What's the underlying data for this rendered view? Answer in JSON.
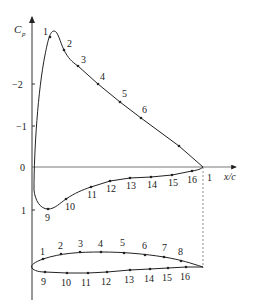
{
  "diagram": {
    "y_axis_label": "C",
    "y_axis_label_sub": "p",
    "x_axis_label": "x/c",
    "y_ticks": [
      {
        "label": "−2",
        "y": 84
      },
      {
        "label": "−1",
        "y": 126
      },
      {
        "label": "0",
        "y": 167
      },
      {
        "label": "1",
        "y": 210
      }
    ],
    "te_label": "1",
    "upper_points": [
      {
        "label": "1",
        "x": 50,
        "y": 37,
        "lx": 43,
        "ly": 35
      },
      {
        "label": "2",
        "x": 64,
        "y": 50,
        "lx": 67,
        "ly": 47
      },
      {
        "label": "3",
        "x": 78,
        "y": 66,
        "lx": 81,
        "ly": 63
      },
      {
        "label": "4",
        "x": 98,
        "y": 84,
        "lx": 100,
        "ly": 80
      },
      {
        "label": "5",
        "x": 120,
        "y": 102,
        "lx": 122,
        "ly": 97
      },
      {
        "label": "6",
        "x": 141,
        "y": 118,
        "lx": 142,
        "ly": 113
      },
      {
        "label": "7",
        "x": 179,
        "y": 146,
        "lx": 0,
        "ly": 0
      }
    ],
    "lower_points": [
      {
        "label": "9",
        "x": 48,
        "y": 209,
        "lx": 45,
        "ly": 221
      },
      {
        "label": "10",
        "x": 66,
        "y": 199,
        "lx": 65,
        "ly": 210
      },
      {
        "label": "11",
        "x": 91,
        "y": 187,
        "lx": 87,
        "ly": 198
      },
      {
        "label": "12",
        "x": 110,
        "y": 181,
        "lx": 106,
        "ly": 192
      },
      {
        "label": "13",
        "x": 130,
        "y": 178,
        "lx": 126,
        "ly": 189
      },
      {
        "label": "14",
        "x": 151,
        "y": 177,
        "lx": 147,
        "ly": 188
      },
      {
        "label": "15",
        "x": 172,
        "y": 175,
        "lx": 168,
        "ly": 186
      },
      {
        "label": "16",
        "x": 192,
        "y": 171,
        "lx": 187,
        "ly": 183
      }
    ],
    "airfoil_upper_points": [
      {
        "label": "1",
        "x": 43,
        "y": 259,
        "lx": 40,
        "ly": 255
      },
      {
        "label": "2",
        "x": 61,
        "y": 254,
        "lx": 58,
        "ly": 249
      },
      {
        "label": "3",
        "x": 80,
        "y": 252,
        "lx": 78,
        "ly": 247
      },
      {
        "label": "4",
        "x": 101,
        "y": 252,
        "lx": 98,
        "ly": 247
      },
      {
        "label": "5",
        "x": 124,
        "y": 253,
        "lx": 120,
        "ly": 246
      },
      {
        "label": "6",
        "x": 145,
        "y": 255,
        "lx": 142,
        "ly": 249
      },
      {
        "label": "7",
        "x": 164,
        "y": 257,
        "lx": 162,
        "ly": 251
      },
      {
        "label": "8",
        "x": 181,
        "y": 261,
        "lx": 178,
        "ly": 255
      }
    ],
    "airfoil_lower_points": [
      {
        "label": "9",
        "x": 45,
        "y": 272,
        "lx": 41,
        "ly": 285
      },
      {
        "label": "10",
        "x": 67,
        "y": 273,
        "lx": 61,
        "ly": 286
      },
      {
        "label": "11",
        "x": 88,
        "y": 273,
        "lx": 81,
        "ly": 286
      },
      {
        "label": "12",
        "x": 107,
        "y": 272,
        "lx": 101,
        "ly": 285
      },
      {
        "label": "13",
        "x": 130,
        "y": 270,
        "lx": 124,
        "ly": 283
      },
      {
        "label": "14",
        "x": 150,
        "y": 269,
        "lx": 144,
        "ly": 282
      },
      {
        "label": "15",
        "x": 168,
        "y": 268,
        "lx": 162,
        "ly": 281
      },
      {
        "label": "16",
        "x": 186,
        "y": 267,
        "lx": 180,
        "ly": 280
      }
    ]
  }
}
